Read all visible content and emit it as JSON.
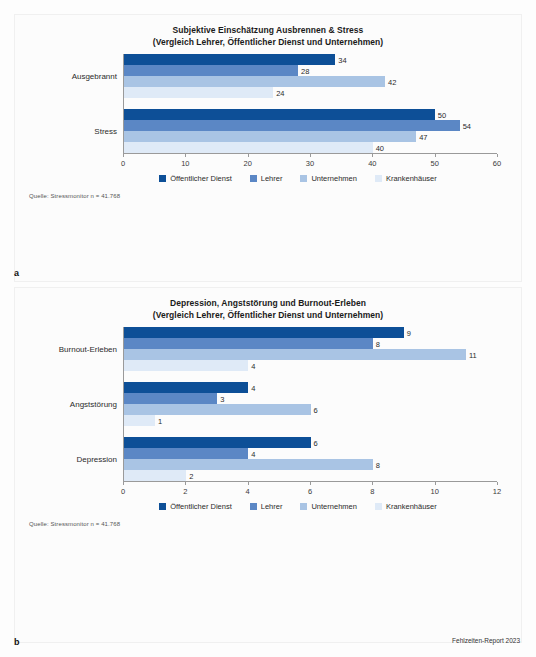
{
  "document": {
    "credit": "Fehlzeiten-Report 2023"
  },
  "panels": [
    {
      "letter": "a",
      "title_line1": "Subjektive Einschätzung Ausbrennen & Stress",
      "title_line2": "(Vergleich Lehrer, Öffentlicher Dienst und Unternehmen)",
      "source": "Quelle: Stressmonitor  n = 41.768"
    },
    {
      "letter": "b",
      "title_line1": "Depression, Angststörung und Burnout-Erleben",
      "title_line2": "(Vergleich Lehrer, Öffentlicher Dienst und Unternehmen)",
      "source": "Quelle: Stressmonitor  n = 41.768"
    }
  ],
  "legend": {
    "items": [
      {
        "label": "Öffentlicher Dienst",
        "color": "#0d4f97"
      },
      {
        "label": "Lehrer",
        "color": "#5b87c5"
      },
      {
        "label": "Unternehmen",
        "color": "#a9c4e4"
      },
      {
        "label": "Krankenhäuser",
        "color": "#dfeaf7"
      }
    ]
  },
  "chart_data": [
    {
      "type": "bar",
      "orientation": "horizontal",
      "title": "Subjektive Einschätzung Ausbrennen & Stress (Vergleich Lehrer, Öffentlicher Dienst und Unternehmen)",
      "xlabel": "",
      "ylabel": "",
      "xlim": [
        0,
        60
      ],
      "xticks": [
        0,
        10,
        20,
        30,
        40,
        50,
        60
      ],
      "grid": false,
      "legend_position": "bottom",
      "categories": [
        "Ausgebrannt",
        "Stress"
      ],
      "series": [
        {
          "name": "Öffentlicher Dienst",
          "color": "#0d4f97",
          "values": [
            34,
            50
          ]
        },
        {
          "name": "Lehrer",
          "color": "#5b87c5",
          "values": [
            28,
            54
          ]
        },
        {
          "name": "Unternehmen",
          "color": "#a9c4e4",
          "values": [
            42,
            47
          ]
        },
        {
          "name": "Krankenhäuser",
          "color": "#dfeaf7",
          "values": [
            24,
            40
          ]
        }
      ],
      "annotation": "Quelle: Stressmonitor  n = 41.768"
    },
    {
      "type": "bar",
      "orientation": "horizontal",
      "title": "Depression, Angststörung und Burnout-Erleben (Vergleich Lehrer, Öffentlicher Dienst und Unternehmen)",
      "xlabel": "",
      "ylabel": "",
      "xlim": [
        0,
        12
      ],
      "xticks": [
        0,
        2,
        4,
        6,
        8,
        10,
        12
      ],
      "grid": false,
      "legend_position": "bottom",
      "categories": [
        "Burnout-Erleben",
        "Angststörung",
        "Depression"
      ],
      "series": [
        {
          "name": "Öffentlicher Dienst",
          "color": "#0d4f97",
          "values": [
            9,
            4,
            6
          ]
        },
        {
          "name": "Lehrer",
          "color": "#5b87c5",
          "values": [
            8,
            3,
            4
          ]
        },
        {
          "name": "Unternehmen",
          "color": "#a9c4e4",
          "values": [
            11,
            6,
            8
          ]
        },
        {
          "name": "Krankenhäuser",
          "color": "#dfeaf7",
          "values": [
            4,
            1,
            2
          ]
        }
      ],
      "annotation": "Quelle: Stressmonitor  n = 41.768"
    }
  ]
}
